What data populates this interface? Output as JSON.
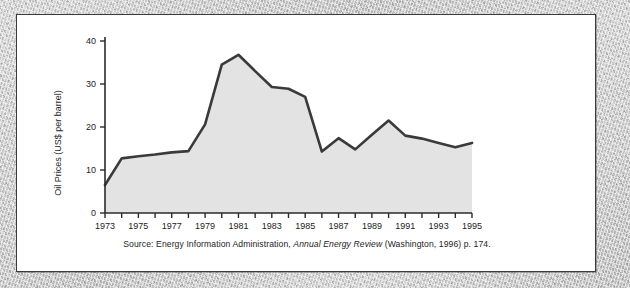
{
  "figure": {
    "panel_name": "oil-price-figure-panel",
    "background_color": "#ffffff",
    "border_color": "#3b3b3b",
    "outer_texture_color": "#c6c6c6"
  },
  "caption": {
    "prefix": "Source: Energy Information Administration, ",
    "italic_title": "Annual Energy Review",
    "suffix": " (Washington, 1996) p. 174."
  },
  "chart_data": {
    "type": "area",
    "title": "",
    "xlabel": "",
    "ylabel": "Oil Prices (US$ per barrel)",
    "xlim": [
      1973,
      1995
    ],
    "ylim": [
      0,
      40
    ],
    "yticks": [
      0,
      10,
      20,
      30,
      40
    ],
    "ytick_labels": [
      "0",
      "10",
      "20",
      "30",
      "40"
    ],
    "xticks": [
      1973,
      1974,
      1975,
      1976,
      1977,
      1978,
      1979,
      1980,
      1981,
      1982,
      1983,
      1984,
      1985,
      1986,
      1987,
      1988,
      1989,
      1990,
      1991,
      1992,
      1993,
      1994,
      1995
    ],
    "xtick_labels_shown": [
      "1973",
      "1975",
      "1977",
      "1979",
      "1981",
      "1983",
      "1985",
      "1987",
      "1989",
      "1991",
      "1993",
      "1995"
    ],
    "grid": false,
    "legend": false,
    "line_color": "#3a3a3a",
    "fill_color": "#e3e3e3",
    "x": [
      1973,
      1974,
      1975,
      1976,
      1977,
      1978,
      1979,
      1980,
      1981,
      1982,
      1983,
      1984,
      1985,
      1986,
      1987,
      1988,
      1989,
      1990,
      1991,
      1992,
      1993,
      1994,
      1995
    ],
    "values": [
      6.5,
      12.7,
      13.2,
      13.6,
      14.1,
      14.4,
      20.6,
      34.5,
      36.8,
      33.0,
      29.3,
      28.9,
      27.0,
      14.3,
      17.4,
      14.8,
      18.2,
      21.5,
      18.0,
      17.3,
      16.3,
      15.3,
      16.3
    ],
    "series": [
      {
        "name": "Oil Prices (US$ per barrel)",
        "values": [
          6.5,
          12.7,
          13.2,
          13.6,
          14.1,
          14.4,
          20.6,
          34.5,
          36.8,
          33.0,
          29.3,
          28.9,
          27.0,
          14.3,
          17.4,
          14.8,
          18.2,
          21.5,
          18.0,
          17.3,
          16.3,
          15.3,
          16.3
        ]
      }
    ]
  }
}
